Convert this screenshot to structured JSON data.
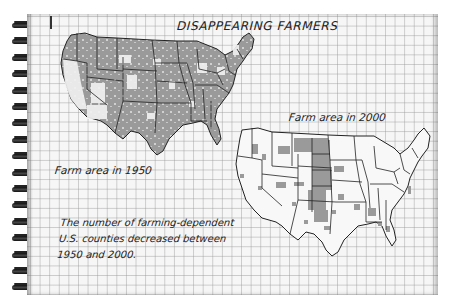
{
  "title": "DISAPPEARING FARMERS",
  "maps": [
    {
      "id": "1950",
      "label": "Farm area in 1950",
      "coverage": "dense",
      "shade_color": "#9a9a9a"
    },
    {
      "id": "2000",
      "label": "Farm area in 2000",
      "coverage": "sparse",
      "shade_color": "#9a9a9a"
    }
  ],
  "caption": {
    "line1": "The number of farming-dependent",
    "line2": "U.S. counties decreased between",
    "line3": "1950 and 2000."
  },
  "colors": {
    "paper": "#f6f6f6",
    "grid": "#b4b4b4",
    "ink": "#222222",
    "shade": "#9a9a9a"
  },
  "spiral_rings": 17
}
